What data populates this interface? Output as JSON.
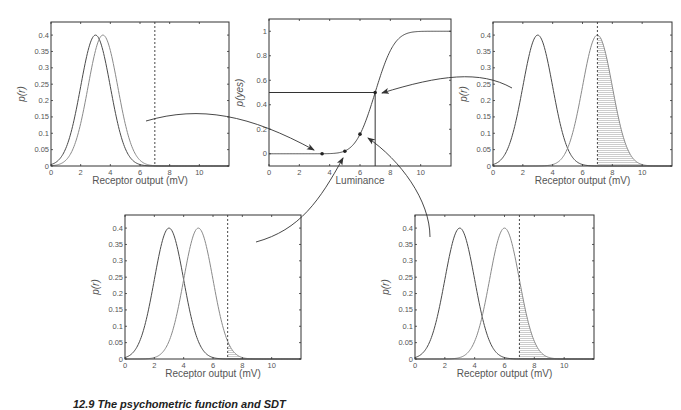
{
  "figure": {
    "caption": "12.9 The psychometric function and SDT",
    "colors": {
      "noise_curve": "#4a4a4a",
      "signal_curve": "#8a8a8a",
      "axis": "#333333",
      "criterion": "#333333",
      "hatch": "#aaaaaa",
      "text": "#555555",
      "arrow": "#333333"
    },
    "criterion_mv": 7
  },
  "chart_data": [
    {
      "id": "panel-top-left",
      "type": "line",
      "title": "",
      "xlabel": "Receptor output (mV)",
      "ylabel": "p(r)",
      "xlim": [
        0,
        12
      ],
      "ylim": [
        0,
        0.44
      ],
      "xticks": [
        0,
        2,
        4,
        6,
        8,
        10
      ],
      "yticks": [
        0,
        0.05,
        0.1,
        0.15,
        0.2,
        0.25,
        0.3,
        0.35,
        0.4
      ],
      "series": [
        {
          "name": "noise",
          "mean": 3,
          "sd": 1,
          "peak": 0.4
        },
        {
          "name": "signal",
          "mean": 3.5,
          "sd": 1,
          "peak": 0.4
        }
      ],
      "criterion": 7,
      "shaded_above_criterion": false
    },
    {
      "id": "panel-center",
      "type": "line",
      "title": "",
      "xlabel": "Luminance",
      "ylabel": "p(yes)",
      "xlim": [
        0,
        12
      ],
      "ylim": [
        -0.1,
        1.1
      ],
      "xticks": [
        0,
        2,
        4,
        6,
        8,
        10
      ],
      "yticks": [
        0,
        0.2,
        0.4,
        0.6,
        0.8,
        1
      ],
      "series": [
        {
          "name": "psychometric function",
          "x": [
            0,
            3.5,
            5,
            6,
            7,
            8,
            9,
            10,
            12
          ],
          "y": [
            0,
            0,
            0.02,
            0.16,
            0.5,
            0.84,
            0.98,
            1,
            1
          ]
        }
      ],
      "points": [
        {
          "x": 3.5,
          "y": 0.0
        },
        {
          "x": 5,
          "y": 0.02
        },
        {
          "x": 6,
          "y": 0.16
        },
        {
          "x": 7,
          "y": 0.5
        }
      ],
      "threshold": {
        "x": 7,
        "y": 0.5
      }
    },
    {
      "id": "panel-top-right",
      "type": "line",
      "title": "",
      "xlabel": "Receptor output (mV)",
      "ylabel": "p(r)",
      "xlim": [
        0,
        12
      ],
      "ylim": [
        0,
        0.44
      ],
      "xticks": [
        0,
        2,
        4,
        6,
        8,
        10
      ],
      "yticks": [
        0,
        0.05,
        0.1,
        0.15,
        0.2,
        0.25,
        0.3,
        0.35,
        0.4
      ],
      "series": [
        {
          "name": "noise",
          "mean": 3,
          "sd": 1,
          "peak": 0.4
        },
        {
          "name": "signal",
          "mean": 7,
          "sd": 1,
          "peak": 0.4
        }
      ],
      "criterion": 7,
      "shaded_above_criterion": true
    },
    {
      "id": "panel-bottom-left",
      "type": "line",
      "title": "",
      "xlabel": "Receptor output (mV)",
      "ylabel": "p(r)",
      "xlim": [
        0,
        12
      ],
      "ylim": [
        0,
        0.44
      ],
      "xticks": [
        0,
        2,
        4,
        6,
        8,
        10
      ],
      "yticks": [
        0,
        0.05,
        0.1,
        0.15,
        0.2,
        0.25,
        0.3,
        0.35,
        0.4
      ],
      "series": [
        {
          "name": "noise",
          "mean": 3,
          "sd": 1,
          "peak": 0.4
        },
        {
          "name": "signal",
          "mean": 5,
          "sd": 1,
          "peak": 0.4
        }
      ],
      "criterion": 7,
      "shaded_above_criterion": true
    },
    {
      "id": "panel-bottom-right",
      "type": "line",
      "title": "",
      "xlabel": "Receptor output (mV)",
      "ylabel": "p(r)",
      "xlim": [
        0,
        12
      ],
      "ylim": [
        0,
        0.44
      ],
      "xticks": [
        0,
        2,
        4,
        6,
        8,
        10
      ],
      "yticks": [
        0,
        0.05,
        0.1,
        0.15,
        0.2,
        0.25,
        0.3,
        0.35,
        0.4
      ],
      "series": [
        {
          "name": "noise",
          "mean": 3,
          "sd": 1,
          "peak": 0.4
        },
        {
          "name": "signal",
          "mean": 6,
          "sd": 1,
          "peak": 0.4
        }
      ],
      "criterion": 7,
      "shaded_above_criterion": true
    }
  ],
  "layout": {
    "panels": {
      "panel-top-left": {
        "x0": 51,
        "y0": 22,
        "x1": 229,
        "y1": 166
      },
      "panel-center": {
        "x0": 269,
        "y0": 19,
        "x1": 451,
        "y1": 166
      },
      "panel-top-right": {
        "x0": 493,
        "y0": 22,
        "x1": 672,
        "y1": 166
      },
      "panel-bottom-left": {
        "x0": 125,
        "y0": 215,
        "x1": 301,
        "y1": 359
      },
      "panel-bottom-right": {
        "x0": 415,
        "y0": 215,
        "x1": 594,
        "y1": 359
      }
    },
    "arrows": [
      {
        "name": "arrow-top-left-to-point-3-5",
        "d": "M146,121 C200,105 250,115 314,150",
        "head": [
          314,
          150
        ]
      },
      {
        "name": "arrow-top-right-to-point-7",
        "d": "M512,88 C480,70 440,75 382,93",
        "head": [
          382,
          93
        ]
      },
      {
        "name": "arrow-bottom-left-to-point-5",
        "d": "M256,242 C300,230 320,200 343,158",
        "head": [
          343,
          158
        ]
      },
      {
        "name": "arrow-bottom-right-to-point-6",
        "d": "M430,237 C430,200 400,160 368,138",
        "head": [
          368,
          138
        ]
      }
    ]
  }
}
